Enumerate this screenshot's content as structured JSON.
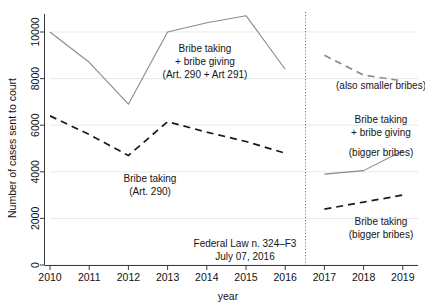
{
  "chart_data": {
    "type": "line",
    "title": "",
    "xlabel": "year",
    "ylabel": "Number of cases sent to court",
    "xlim": [
      2009.6,
      2019.4
    ],
    "ylim": [
      0,
      11200
    ],
    "grid": "horizontal",
    "legend": "none",
    "x_ticks": [
      "2010",
      "2011",
      "2012",
      "2013",
      "2014",
      "2015",
      "2016",
      "2017",
      "2018",
      "2019"
    ],
    "y_ticks": [
      "0",
      "2000",
      "4000",
      "6000",
      "8000",
      "10000"
    ],
    "series": [
      {
        "name": "Bribe taking + bribe giving (Art. 290 + Art 291)",
        "style": "solid",
        "color": "#8a8a8a",
        "x": [
          2010,
          2011,
          2012,
          2013,
          2014,
          2015,
          2016
        ],
        "values": [
          10000,
          8700,
          6900,
          10000,
          10400,
          10700,
          8400
        ]
      },
      {
        "name": "Bribe taking (Art. 290)",
        "style": "dashed",
        "color": "#1a1a1a",
        "x": [
          2010,
          2011,
          2012,
          2013,
          2014,
          2015,
          2016
        ],
        "values": [
          6400,
          5600,
          4700,
          6150,
          5700,
          5300,
          4800
        ]
      },
      {
        "name": "Bribe taking + bribe giving (also smaller bribes)",
        "style": "dashed",
        "color": "#8a8a8a",
        "x": [
          2017,
          2018,
          2019
        ],
        "values": [
          9000,
          8150,
          7900
        ]
      },
      {
        "name": "Bribe taking + bribe giving (bigger bribes)",
        "style": "solid",
        "color": "#8a8a8a",
        "x": [
          2017,
          2018,
          2019
        ],
        "values": [
          3900,
          4050,
          4900
        ]
      },
      {
        "name": "Bribe taking (bigger bribes)",
        "style": "dashed",
        "color": "#1a1a1a",
        "x": [
          2017,
          2018,
          2019
        ],
        "values": [
          2400,
          2700,
          3000
        ]
      }
    ],
    "vertical_marker": {
      "x": 2016.52,
      "style": "dotted",
      "label_line1": "Federal Law n. 324–F3",
      "label_line2": "July 07, 2016"
    },
    "annotations": [
      {
        "id": "annot-bribe-taking-giving",
        "lines": [
          "Bribe taking",
          "+ bribe giving",
          "(Art. 290 + Art 291)"
        ],
        "x": 205,
        "y": 52
      },
      {
        "id": "annot-bribe-taking-290",
        "lines": [
          "Bribe taking",
          "(Art. 290)"
        ],
        "x": 150,
        "y": 178
      },
      {
        "id": "annot-also-smaller-bribes",
        "lines": [
          "(also smaller bribes)"
        ],
        "x": 382,
        "y": 87
      },
      {
        "id": "annot-bigger-bribes-both",
        "lines": [
          "Bribe taking",
          "+ bribe giving",
          "(bigger bribes)"
        ],
        "x": 382,
        "y": 124
      },
      {
        "id": "annot-bribe-taking-bigger",
        "lines": [
          "Bribe taking",
          "(bigger bribes)"
        ],
        "x": 382,
        "y": 222
      }
    ]
  },
  "axes": {
    "y_title": "Number of cases sent to court",
    "x_title": "year",
    "y_tick_0": "0",
    "y_tick_1": "2000",
    "y_tick_2": "4000",
    "y_tick_3": "6000",
    "y_tick_4": "8000",
    "y_tick_5": "10000",
    "x_tick_0": "2010",
    "x_tick_1": "2011",
    "x_tick_2": "2012",
    "x_tick_3": "2013",
    "x_tick_4": "2014",
    "x_tick_5": "2015",
    "x_tick_6": "2016",
    "x_tick_7": "2017",
    "x_tick_8": "2018",
    "x_tick_9": "2019"
  },
  "annotation_text": {
    "a1_l1": "Bribe taking",
    "a1_l2": "+ bribe giving",
    "a1_l3": "(Art. 290 + Art 291)",
    "a2_l1": "Bribe taking",
    "a2_l2": "(Art. 290)",
    "a3_l1": "(also smaller bribes)",
    "a4_l1": "Bribe taking",
    "a4_l2": "+ bribe giving",
    "a4_l3": "(bigger bribes)",
    "a5_l1": "Bribe taking",
    "a5_l2": "(bigger bribes)",
    "law_l1": "Federal Law n. 324–F3",
    "law_l2": "July 07, 2016"
  },
  "colors": {
    "grid": "#e8e8e8",
    "axis": "#3a3a3a",
    "series_gray": "#8a8a8a",
    "series_black": "#1a1a1a",
    "background": "#ffffff"
  }
}
